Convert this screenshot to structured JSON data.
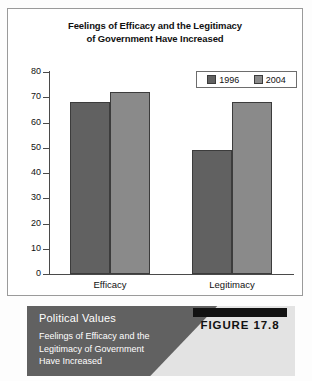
{
  "figure": {
    "title_line1": "Feelings of Efficacy and the Legitimacy",
    "title_line2": "of Government Have Increased",
    "badge_label": "FIGURE 17.8"
  },
  "caption": {
    "heading": "Political Values",
    "desc_line1": "Feelings of Efficacy and the",
    "desc_line2": "Legitimacy of Government",
    "desc_line3": "Have Increased"
  },
  "colors": {
    "series_1996": "#616161",
    "series_2004": "#8a8a8a",
    "caption_dark": "#616161",
    "caption_light": "#e3e3e3",
    "axis": "#4a4a4a",
    "frame": "#9a9a9a"
  },
  "chart_data": {
    "type": "bar",
    "title": "Feelings of Efficacy and the Legitimacy of Government Have Increased",
    "xlabel": "",
    "ylabel": "",
    "categories": [
      "Efficacy",
      "Legitimacy"
    ],
    "series": [
      {
        "name": "1996",
        "values": [
          68,
          49
        ]
      },
      {
        "name": "2004",
        "values": [
          72,
          68
        ]
      }
    ],
    "ylim": [
      0,
      80
    ],
    "yticks": [
      0,
      10,
      20,
      30,
      40,
      50,
      60,
      70,
      80
    ],
    "ytick_labels": [
      "0",
      "10",
      "20",
      "30",
      "40",
      "50",
      "60",
      "70",
      "80"
    ],
    "grid": false,
    "legend_position": "top-right",
    "legend_entries": [
      "1996",
      "2004"
    ]
  }
}
